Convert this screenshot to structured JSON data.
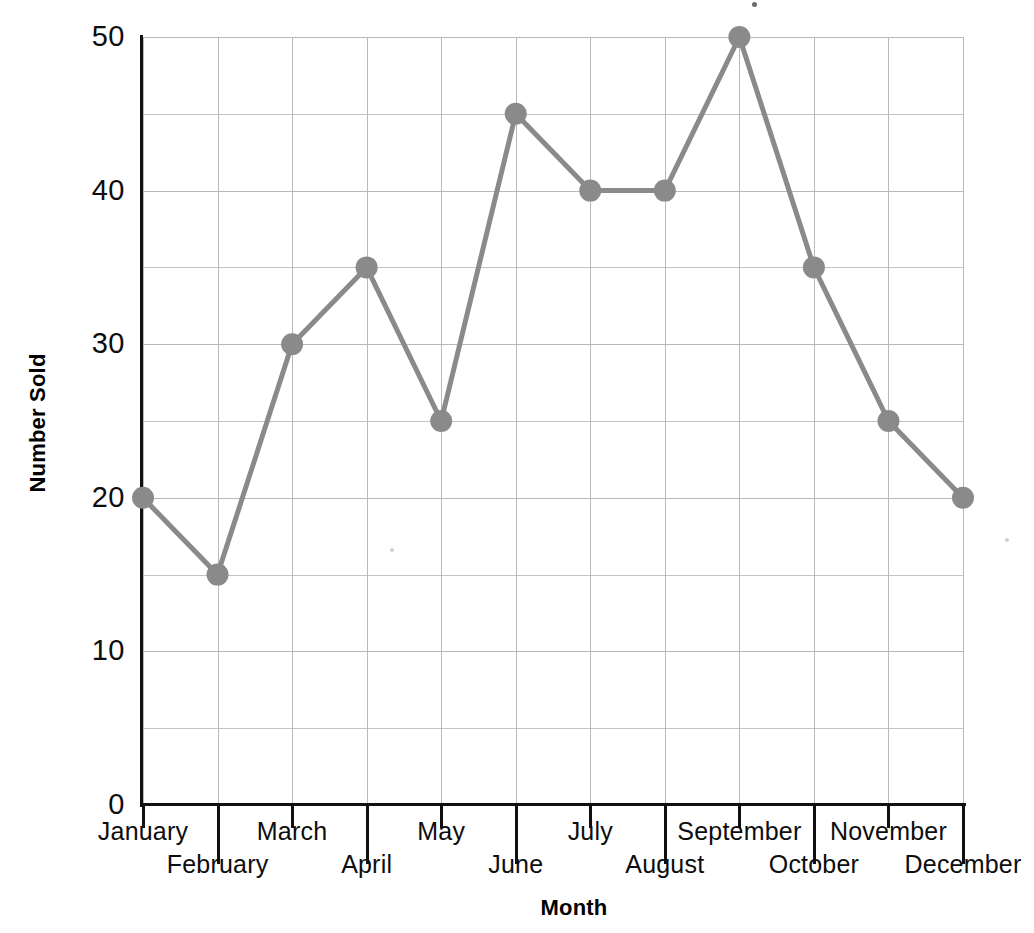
{
  "chart_data": {
    "type": "line",
    "title": "",
    "xlabel": "Month",
    "ylabel": "Number Sold",
    "categories": [
      "January",
      "February",
      "March",
      "April",
      "May",
      "June",
      "July",
      "August",
      "September",
      "October",
      "November",
      "December"
    ],
    "values": [
      20,
      15,
      30,
      35,
      25,
      45,
      40,
      40,
      50,
      35,
      25,
      20
    ],
    "series": [
      {
        "name": "Number Sold",
        "values": [
          20,
          15,
          30,
          35,
          25,
          45,
          40,
          40,
          50,
          35,
          25,
          20
        ]
      }
    ],
    "ylim": [
      0,
      50
    ],
    "ytick_labels": [
      "0",
      "10",
      "20",
      "30",
      "40",
      "50"
    ],
    "ytick_values": [
      0,
      10,
      20,
      30,
      40,
      50
    ],
    "y_minor_step": 5,
    "grid": true,
    "legend": "none",
    "line_color": "#8a8a8a",
    "marker_color": "#8a8a8a",
    "marker_shape": "circle",
    "gridline_color": "#b9b9b9",
    "axis_color": "#111111"
  },
  "axes": {
    "y_title": "Number Sold",
    "x_title": "Month"
  }
}
